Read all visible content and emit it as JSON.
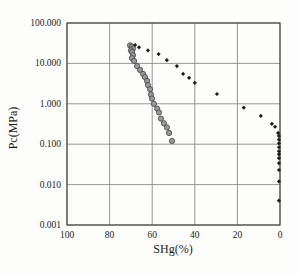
{
  "figure": {
    "background": "#fdfdfb",
    "plot_border_color": "#3f3f3f",
    "grid_color": "#8a8a8a",
    "circle_series_fill": "#9a9a9a",
    "circle_series_stroke": "#4c4c4c",
    "diamond_series_color": "#1d1d1d"
  },
  "chart_data": {
    "type": "scatter",
    "title": "",
    "xlabel": "SHg(%)",
    "ylabel": "Pc(MPa)",
    "x_axis_reversed": true,
    "xlim": [
      100,
      0
    ],
    "x_ticks": [
      100,
      80,
      60,
      40,
      20,
      0
    ],
    "x_tick_labels": [
      "100",
      "80",
      "60",
      "40",
      "20",
      "0"
    ],
    "y_scale": "log",
    "ylim": [
      0.001,
      100
    ],
    "y_ticks": [
      100,
      10,
      1,
      0.1,
      0.01,
      0.001
    ],
    "y_tick_labels": [
      "100.000",
      "10.000",
      "1.000",
      "0.100",
      "0.010",
      "0.001"
    ],
    "grid": true,
    "legend": "none",
    "series": [
      {
        "name": "gray-circle-series",
        "marker": "circle",
        "points": [
          [
            70.4,
            28
          ],
          [
            69.5,
            26
          ],
          [
            69.0,
            23.5
          ],
          [
            70.0,
            21
          ],
          [
            69.5,
            19
          ],
          [
            69.0,
            16
          ],
          [
            69.5,
            13.5
          ],
          [
            68.5,
            11.5
          ],
          [
            67.1,
            8.6
          ],
          [
            65.7,
            6.9
          ],
          [
            64.3,
            5.5
          ],
          [
            63.4,
            4.6
          ],
          [
            62.4,
            3.7
          ],
          [
            62.0,
            2.9
          ],
          [
            61.0,
            2.3
          ],
          [
            60.6,
            1.7
          ],
          [
            60.1,
            1.35
          ],
          [
            59.2,
            1.0
          ],
          [
            57.7,
            0.76
          ],
          [
            56.8,
            0.61
          ],
          [
            55.9,
            0.43
          ],
          [
            54.5,
            0.33
          ],
          [
            53.1,
            0.26
          ],
          [
            52.1,
            0.19
          ],
          [
            50.7,
            0.12
          ]
        ]
      },
      {
        "name": "black-diamond-series",
        "marker": "diamond",
        "points": [
          [
            68.0,
            28.5
          ],
          [
            66.2,
            25
          ],
          [
            62.0,
            21
          ],
          [
            57.0,
            17
          ],
          [
            53.1,
            12
          ],
          [
            48.4,
            8.6
          ],
          [
            45.5,
            5.5
          ],
          [
            42.7,
            4.4
          ],
          [
            40.0,
            3.3
          ],
          [
            29.6,
            1.75
          ],
          [
            17.0,
            0.8
          ],
          [
            9.0,
            0.5
          ],
          [
            3.8,
            0.32
          ],
          [
            2.3,
            0.27
          ],
          [
            0.9,
            0.19
          ],
          [
            0.5,
            0.16
          ],
          [
            0.5,
            0.13
          ],
          [
            0.5,
            0.105
          ],
          [
            0.5,
            0.084
          ],
          [
            0.5,
            0.067
          ],
          [
            0.5,
            0.056
          ],
          [
            0.5,
            0.045
          ],
          [
            0.5,
            0.034
          ],
          [
            0.5,
            0.023
          ],
          [
            0.5,
            0.012
          ],
          [
            0.5,
            0.004
          ]
        ]
      }
    ]
  }
}
